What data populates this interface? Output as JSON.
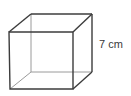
{
  "figure": {
    "type": "cube",
    "dimension_label": "7 cm",
    "colors": {
      "front_edges": "#3c3c3c",
      "back_edges": "#9a9a9a",
      "label": "#3a3a3a",
      "background": "#ffffff"
    },
    "vertices": {
      "front_top_left": [
        9,
        32
      ],
      "front_top_right": [
        73,
        32
      ],
      "front_bottom_right": [
        73,
        89
      ],
      "front_bottom_left": [
        10,
        89
      ],
      "back_top_left": [
        31,
        14
      ],
      "back_top_right": [
        92,
        14
      ],
      "back_bottom_right": [
        92,
        72
      ],
      "back_bottom_left": [
        31,
        72
      ]
    }
  }
}
